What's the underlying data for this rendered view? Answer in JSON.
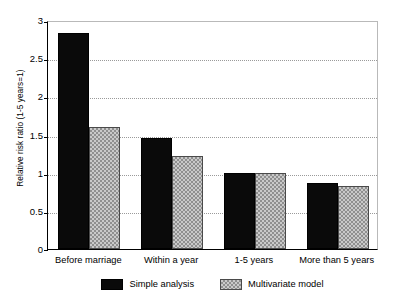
{
  "chart_data": {
    "type": "bar",
    "title": "",
    "subtitle": "",
    "xlabel": "",
    "ylabel": "Relative risk ratio (1-5 years=1)",
    "categories": [
      "Before marriage",
      "Within a year",
      "1-5 years",
      "More than 5 years"
    ],
    "series": [
      {
        "name": "Simple analysis",
        "color": "#0a0a0a",
        "fill": "solid-black",
        "values": [
          2.83,
          1.46,
          0.99,
          0.87
        ]
      },
      {
        "name": "Multivariate model",
        "color": "#c9c9c9",
        "fill": "gray-checkered",
        "values": [
          1.6,
          1.22,
          0.99,
          0.82
        ]
      }
    ],
    "ylim": [
      0,
      3
    ],
    "ytick_values": [
      0,
      0.5,
      1,
      1.5,
      2,
      2.5,
      3
    ],
    "ytick_labels": [
      "0",
      "0.5",
      "1",
      "1.5",
      "2",
      "2.5",
      "3"
    ],
    "grid": true,
    "grid_axis": "y",
    "grid_style": "dotted",
    "legend_position": "bottom-center",
    "annotations": []
  },
  "legend": {
    "entries": [
      {
        "label": "Simple analysis"
      },
      {
        "label": "Multivariate model"
      }
    ]
  },
  "colors": {
    "series_simple": "#0a0a0a",
    "series_multivariate": "#c9c9c9",
    "axis": "#000000",
    "gridline": "#9a9a9a",
    "background": "#ffffff"
  }
}
